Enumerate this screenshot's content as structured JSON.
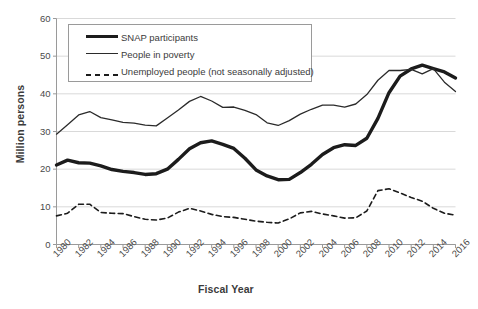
{
  "chart_data": {
    "type": "line",
    "title": "",
    "xlabel": "Fiscal Year",
    "ylabel": "Million persons",
    "xlim": [
      1980,
      2016
    ],
    "ylim": [
      0,
      60
    ],
    "yticks": [
      0,
      10,
      20,
      30,
      40,
      50,
      60
    ],
    "xticks": [
      1980,
      1982,
      1984,
      1986,
      1988,
      1990,
      1992,
      1994,
      1996,
      1998,
      2000,
      2002,
      2004,
      2006,
      2008,
      2010,
      2012,
      2014,
      2016
    ],
    "grid": "horizontal",
    "legend_position": "top-left-inside",
    "x": [
      1980,
      1981,
      1982,
      1983,
      1984,
      1985,
      1986,
      1987,
      1988,
      1989,
      1990,
      1991,
      1992,
      1993,
      1994,
      1995,
      1996,
      1997,
      1998,
      1999,
      2000,
      2001,
      2002,
      2003,
      2004,
      2005,
      2006,
      2007,
      2008,
      2009,
      2010,
      2011,
      2012,
      2013,
      2014,
      2015,
      2016
    ],
    "series": [
      {
        "name": "SNAP participants",
        "style": "thick-solid",
        "color": "#1c1c1c",
        "values": [
          21.1,
          22.4,
          21.7,
          21.6,
          20.9,
          19.9,
          19.4,
          19.1,
          18.6,
          18.8,
          20.0,
          22.6,
          25.4,
          27.0,
          27.5,
          26.6,
          25.5,
          22.9,
          19.8,
          18.2,
          17.2,
          17.3,
          19.1,
          21.3,
          23.9,
          25.7,
          26.5,
          26.3,
          28.2,
          33.5,
          40.3,
          44.7,
          46.6,
          47.6,
          46.7,
          45.8,
          44.2
        ]
      },
      {
        "name": "People in poverty",
        "style": "thin-solid",
        "color": "#2b2b2b",
        "values": [
          29.3,
          31.8,
          34.4,
          35.3,
          33.7,
          33.1,
          32.4,
          32.2,
          31.7,
          31.5,
          33.6,
          35.7,
          38.0,
          39.3,
          38.1,
          36.4,
          36.5,
          35.6,
          34.5,
          32.3,
          31.6,
          32.9,
          34.6,
          35.9,
          37.0,
          37.0,
          36.5,
          37.3,
          39.8,
          43.6,
          46.2,
          46.2,
          46.5,
          45.3,
          46.7,
          43.1,
          40.6
        ]
      },
      {
        "name": "Unemployed people (not seasonally adjusted)",
        "style": "dashed",
        "color": "#1c1c1c",
        "values": [
          7.6,
          8.3,
          10.7,
          10.7,
          8.5,
          8.3,
          8.2,
          7.4,
          6.7,
          6.5,
          7.0,
          8.6,
          9.6,
          8.9,
          8.0,
          7.4,
          7.2,
          6.7,
          6.2,
          5.9,
          5.7,
          6.8,
          8.4,
          8.8,
          8.1,
          7.6,
          7.0,
          7.1,
          8.9,
          14.3,
          14.8,
          13.7,
          12.5,
          11.5,
          9.6,
          8.3,
          7.8
        ]
      }
    ]
  },
  "legend": {
    "items": [
      {
        "label": "SNAP participants",
        "swatch": "thick-solid-line-icon"
      },
      {
        "label": "People in poverty",
        "swatch": "thin-solid-line-icon"
      },
      {
        "label": "Unemployed people (not seasonally adjusted)",
        "swatch": "dashed-line-icon"
      }
    ]
  },
  "axes": {
    "y_title": "Million persons",
    "x_title": "Fiscal Year",
    "y_tick_labels": [
      "60",
      "50",
      "40",
      "30",
      "20",
      "10",
      "0"
    ],
    "x_tick_labels": [
      "1980",
      "1982",
      "1984",
      "1986",
      "1988",
      "1990",
      "1992",
      "1994",
      "1996",
      "1998",
      "2000",
      "2002",
      "2004",
      "2006",
      "2008",
      "2010",
      "2012",
      "2014",
      "2016"
    ]
  },
  "colors": {
    "grid": "#d9d9d9",
    "axis": "#9a9a9a",
    "snap": "#1c1c1c",
    "poverty": "#2b2b2b",
    "unemployed": "#1c1c1c",
    "background": "#ffffff"
  }
}
